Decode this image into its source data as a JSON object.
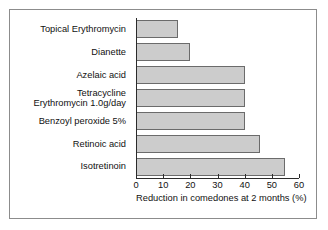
{
  "chart_data": {
    "type": "bar",
    "orientation": "horizontal",
    "title": "",
    "xlabel": "Reduction in comedones at 2 months (%)",
    "ylabel": "",
    "xlim": [
      0,
      60
    ],
    "xticks": [
      0,
      10,
      20,
      30,
      40,
      50,
      60
    ],
    "xtick_labels": [
      "0",
      "10",
      "20",
      "30",
      "40",
      "50",
      "60"
    ],
    "grid": false,
    "legend": null,
    "categories": [
      "Topical Erythromycin",
      "Dianette",
      "Azelaic acid",
      "Tetracycline\nErythromycin 1.0g/day",
      "Benzoyl peroxide 5%",
      "Retinoic acid",
      "Isotretinoin"
    ],
    "values": [
      15.5,
      20,
      40,
      40,
      40,
      45.5,
      55
    ],
    "bar_fill_color": "#cccccc",
    "bar_border_color": "#6b6b6b",
    "axis_color": "#2b2b2b",
    "frame_color": "#8c8c8c",
    "background_color": "#ffffff"
  }
}
